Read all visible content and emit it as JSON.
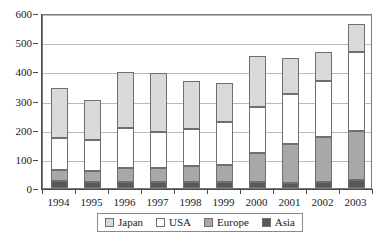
{
  "chart_data": {
    "type": "bar",
    "stacked": true,
    "title": "",
    "xlabel": "",
    "ylabel": "",
    "ylim": [
      0,
      600
    ],
    "ytick_labels": [
      "0",
      "100",
      "200",
      "300",
      "400",
      "500",
      "600"
    ],
    "yticks": [
      0,
      100,
      200,
      300,
      400,
      500,
      600
    ],
    "grid": true,
    "legend_position": "bottom",
    "categories": [
      "1994",
      "1995",
      "1996",
      "1997",
      "1998",
      "1999",
      "2000",
      "2001",
      "2002",
      "2003"
    ],
    "series": [
      {
        "name": "Asia",
        "color": "#585858",
        "values": [
          25,
          22,
          22,
          20,
          21,
          19,
          20,
          18,
          22,
          28
        ]
      },
      {
        "name": "Europe",
        "color": "#a8a8a8",
        "values": [
          37,
          35,
          48,
          50,
          55,
          60,
          100,
          133,
          152,
          167
        ]
      },
      {
        "name": "USA",
        "color": "#ffffff",
        "values": [
          110,
          106,
          135,
          122,
          126,
          147,
          158,
          170,
          194,
          270
        ]
      },
      {
        "name": "Japan",
        "color": "#d9d9d9",
        "values": [
          172,
          140,
          192,
          204,
          166,
          134,
          174,
          124,
          98,
          97
        ]
      }
    ],
    "cumulative_tops": {
      "1994": {
        "Asia": 25,
        "Europe": 62,
        "USA": 172,
        "Japan": 344
      },
      "1995": {
        "Asia": 22,
        "Europe": 57,
        "USA": 163,
        "Japan": 303
      },
      "1996": {
        "Asia": 22,
        "Europe": 70,
        "USA": 205,
        "Japan": 397
      },
      "1997": {
        "Asia": 20,
        "Europe": 70,
        "USA": 192,
        "Japan": 396
      },
      "1998": {
        "Asia": 21,
        "Europe": 76,
        "USA": 202,
        "Japan": 368
      },
      "1999": {
        "Asia": 19,
        "Europe": 79,
        "USA": 226,
        "Japan": 360
      },
      "2000": {
        "Asia": 20,
        "Europe": 120,
        "USA": 278,
        "Japan": 452
      },
      "2001": {
        "Asia": 18,
        "Europe": 151,
        "USA": 321,
        "Japan": 445
      },
      "2002": {
        "Asia": 22,
        "Europe": 174,
        "USA": 368,
        "Japan": 466
      },
      "2003": {
        "Asia": 28,
        "Europe": 195,
        "USA": 465,
        "Japan": 562
      }
    },
    "totals": [
      344,
      303,
      397,
      396,
      368,
      360,
      452,
      445,
      466,
      562
    ],
    "legend": [
      {
        "label": "Japan",
        "color": "#d9d9d9"
      },
      {
        "label": "USA",
        "color": "#ffffff"
      },
      {
        "label": "Europe",
        "color": "#a8a8a8"
      },
      {
        "label": "Asia",
        "color": "#585858"
      }
    ]
  },
  "colors": {
    "axis": "#4a4a4a",
    "grid": "#b9b9b9",
    "frame": "#7a7a7a",
    "bar_border": "#6f6f6f",
    "background": "#ffffff"
  }
}
